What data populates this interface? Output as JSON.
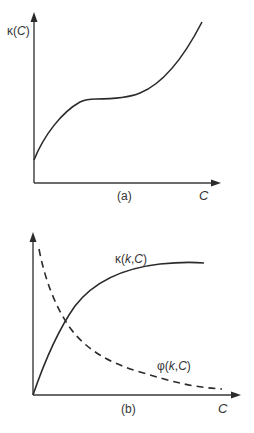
{
  "panels": [
    {
      "id": "a",
      "caption": "(a)",
      "y_label": "κ(C)",
      "x_label": "C",
      "curves": [
        {
          "name": "κ(C)",
          "style": "solid",
          "shape": "rises concavely, plateaus (inflection), then rises convexly"
        }
      ]
    },
    {
      "id": "b",
      "caption": "(b)",
      "y_label": "",
      "x_label": "C",
      "curves": [
        {
          "name": "κ(k,C)",
          "label": "κ(k,C)",
          "style": "solid",
          "shape": "rises from origin, saturates"
        },
        {
          "name": "φ(k,C)",
          "label": "φ(k,C)",
          "style": "dashed",
          "shape": "decays from high value toward zero"
        }
      ]
    }
  ],
  "text": {
    "a_ylabel_kappa": "κ(",
    "a_ylabel_C": "C",
    "a_ylabel_close": ")",
    "a_xlabel": "C",
    "a_caption": "(a)",
    "b_kappa_label_prefix": "κ(",
    "b_kappa_label_k": "k",
    "b_kappa_label_comma": ",",
    "b_kappa_label_C": "C",
    "b_kappa_label_close": ")",
    "b_phi_label_prefix": "φ(",
    "b_phi_label_k": "k",
    "b_phi_label_comma": ",",
    "b_phi_label_C": "C",
    "b_phi_label_close": ")",
    "b_xlabel": "C",
    "b_caption": "(b)"
  }
}
